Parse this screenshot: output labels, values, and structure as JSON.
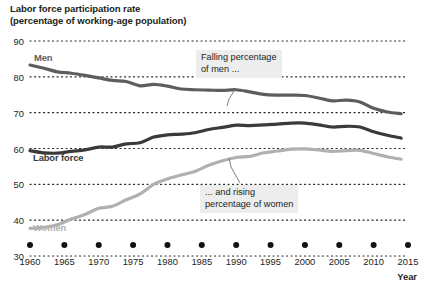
{
  "title": {
    "line1": "Labor force participation rate",
    "line2": "(percentage of working-age population)"
  },
  "axis": {
    "x_title": "Year",
    "y_ticks": [
      "90",
      "80",
      "70",
      "60",
      "50",
      "40",
      "30"
    ],
    "x_ticks": [
      "1960",
      "1965",
      "1970",
      "1975",
      "1980",
      "1985",
      "1990",
      "1995",
      "2000",
      "2005",
      "2010",
      "2015"
    ]
  },
  "series_labels": {
    "men": "Men",
    "labor_force": "Labor force",
    "women": "Women"
  },
  "callouts": {
    "men": {
      "line1": "Falling percentage",
      "line2": "of men ..."
    },
    "women": {
      "line1": "... and rising",
      "line2": "percentage of women"
    }
  },
  "colors": {
    "men": "#5d5d5d",
    "labor_force": "#3a3a3a",
    "women": "#b0b0b0",
    "gridline": "#222222",
    "text": "#231f20",
    "callout_bg": "#ededed",
    "background": "#ffffff"
  },
  "chart_data": {
    "type": "line",
    "title": "Labor force participation rate (percentage of working-age population)",
    "xlabel": "Year",
    "ylabel": "",
    "xlim": [
      1960,
      2015
    ],
    "ylim": [
      30,
      90
    ],
    "ytick_step": 10,
    "xtick_step": 5,
    "grid": "horizontal-dotted",
    "legend": "inline-labels",
    "x": [
      1960,
      1962,
      1964,
      1966,
      1968,
      1970,
      1972,
      1974,
      1976,
      1978,
      1980,
      1982,
      1984,
      1986,
      1988,
      1990,
      1992,
      1994,
      1996,
      1998,
      2000,
      2002,
      2004,
      2006,
      2008,
      2010,
      2012,
      2014
    ],
    "series": [
      {
        "name": "Men",
        "color": "#5d5d5d",
        "values": [
          83.3,
          82.4,
          81.4,
          81.0,
          80.4,
          79.7,
          79.0,
          78.7,
          77.5,
          77.9,
          77.4,
          76.6,
          76.4,
          76.3,
          76.2,
          76.4,
          75.8,
          75.1,
          74.9,
          74.9,
          74.8,
          74.1,
          73.3,
          73.5,
          73.0,
          71.2,
          70.2,
          69.7
        ]
      },
      {
        "name": "Labor force",
        "color": "#3a3a3a",
        "values": [
          59.4,
          58.8,
          58.7,
          59.2,
          59.6,
          60.4,
          60.4,
          61.3,
          61.6,
          63.2,
          63.8,
          64.0,
          64.4,
          65.3,
          65.9,
          66.5,
          66.4,
          66.6,
          66.8,
          67.1,
          67.1,
          66.6,
          66.0,
          66.2,
          66.0,
          64.7,
          63.7,
          62.9
        ]
      },
      {
        "name": "Women",
        "color": "#b0b0b0",
        "values": [
          37.7,
          38.0,
          38.7,
          40.3,
          41.6,
          43.3,
          43.9,
          45.7,
          47.3,
          50.0,
          51.5,
          52.6,
          53.6,
          55.3,
          56.6,
          57.5,
          57.8,
          58.8,
          59.3,
          59.8,
          59.9,
          59.6,
          59.2,
          59.4,
          59.5,
          58.6,
          57.7,
          57.0
        ]
      }
    ],
    "annotations": [
      {
        "text": "Falling percentage of men ...",
        "points_to_series": "Men",
        "points_to_x": 1991
      },
      {
        "text": "... and rising percentage of women",
        "points_to_series": "Women",
        "points_to_x": 1992
      }
    ]
  }
}
